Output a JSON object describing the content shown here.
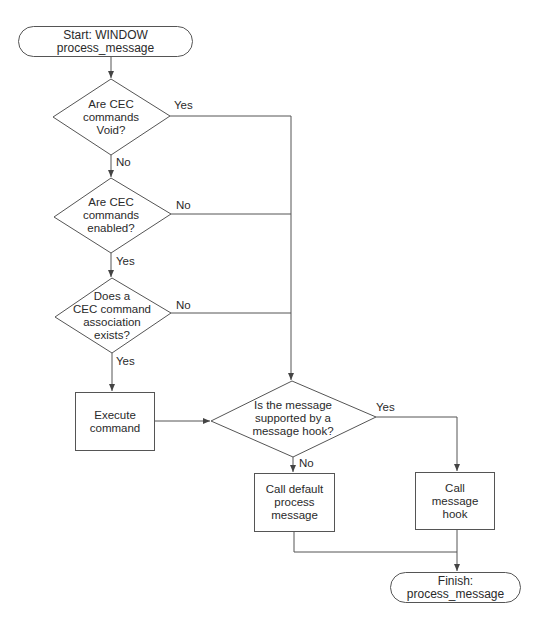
{
  "diagram": {
    "type": "flowchart",
    "nodes": {
      "start": {
        "kind": "terminator",
        "label": "Start: WINDOW process_message"
      },
      "d_void": {
        "kind": "decision",
        "label": "Are CEC\ncommands\nVoid?"
      },
      "d_enabled": {
        "kind": "decision",
        "label": "Are CEC\ncommands\nenabled?"
      },
      "d_assoc": {
        "kind": "decision",
        "label": "Does a\nCEC command\nassociation\nexists?"
      },
      "execute": {
        "kind": "process",
        "label": "Execute\ncommand"
      },
      "d_hook": {
        "kind": "decision",
        "label": "Is the message\nsupported by a\nmessage hook?"
      },
      "call_default": {
        "kind": "process",
        "label": "Call default\nprocess\nmessage"
      },
      "call_hook": {
        "kind": "process",
        "label": "Call\nmessage\nhook"
      },
      "finish": {
        "kind": "terminator",
        "label": "Finish: process_message"
      }
    },
    "edges": {
      "void_yes": "Yes",
      "void_no": "No",
      "enabled_no": "No",
      "enabled_yes": "Yes",
      "assoc_no": "No",
      "assoc_yes": "Yes",
      "hook_yes": "Yes",
      "hook_no": "No"
    },
    "colors": {
      "line": "#555555",
      "text": "#2a2a2a",
      "background": "#ffffff"
    }
  }
}
